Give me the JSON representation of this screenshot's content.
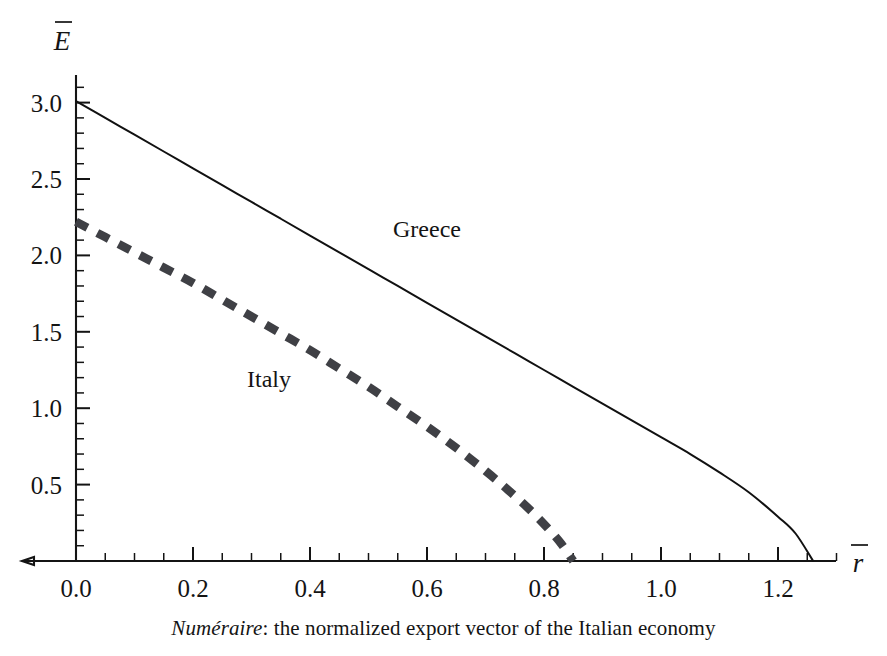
{
  "chart_data": {
    "type": "line",
    "title": "",
    "subtitle": "",
    "caption_emphasis": "Numéraire",
    "caption_rest": ": the normalized export vector of the Italian economy",
    "caption_full": "Numéraire: the normalized export vector of the Italian economy",
    "xlabel": "r",
    "xlabel_display": "r̄",
    "ylabel": "E",
    "ylabel_display": "Ē",
    "xlim": [
      0.0,
      1.32
    ],
    "ylim": [
      0.0,
      3.12
    ],
    "x_major_ticks": [
      0.0,
      0.2,
      0.4,
      0.6,
      0.8,
      1.0,
      1.2
    ],
    "x_tick_labels": [
      "0.0",
      "0.2",
      "0.4",
      "0.6",
      "0.8",
      "1.0",
      "1.2"
    ],
    "x_minor_step": 0.05,
    "y_major_ticks": [
      0.5,
      1.0,
      1.5,
      2.0,
      2.5,
      3.0
    ],
    "y_tick_labels": [
      "0.5",
      "1.0",
      "1.5",
      "2.0",
      "2.5",
      "3.0"
    ],
    "y_minor_step": 0.1,
    "grid": false,
    "legend_position": "inline-annotations",
    "series": [
      {
        "name": "Greece",
        "label": "Greece",
        "style": "solid",
        "color": "#111111",
        "linewidth": 2.0,
        "annotation_x": 0.6,
        "annotation_y": 2.12,
        "intercept_y": 3.01,
        "intercept_x": 1.26,
        "x": [
          0.0,
          0.05,
          0.1,
          0.15,
          0.2,
          0.25,
          0.3,
          0.35,
          0.4,
          0.45,
          0.5,
          0.55,
          0.6,
          0.65,
          0.7,
          0.75,
          0.8,
          0.85,
          0.9,
          0.95,
          1.0,
          1.05,
          1.1,
          1.15,
          1.2,
          1.23,
          1.26
        ],
        "y": [
          3.01,
          2.9,
          2.79,
          2.68,
          2.57,
          2.46,
          2.35,
          2.24,
          2.13,
          2.02,
          1.91,
          1.8,
          1.69,
          1.58,
          1.47,
          1.36,
          1.25,
          1.14,
          1.03,
          0.92,
          0.81,
          0.7,
          0.58,
          0.45,
          0.29,
          0.18,
          0.0
        ]
      },
      {
        "name": "Italy",
        "label": "Italy",
        "style": "dashed",
        "color": "#3f4045",
        "linewidth": 8.5,
        "dash_pattern": [
          13,
          11
        ],
        "annotation_x": 0.33,
        "annotation_y": 1.14,
        "intercept_y": 2.22,
        "intercept_x": 0.85,
        "x": [
          0.0,
          0.05,
          0.1,
          0.15,
          0.2,
          0.25,
          0.3,
          0.35,
          0.4,
          0.45,
          0.5,
          0.55,
          0.6,
          0.65,
          0.7,
          0.74,
          0.78,
          0.81,
          0.83,
          0.85
        ],
        "y": [
          2.22,
          2.12,
          2.02,
          1.92,
          1.82,
          1.71,
          1.6,
          1.49,
          1.38,
          1.26,
          1.14,
          1.01,
          0.88,
          0.74,
          0.59,
          0.46,
          0.32,
          0.2,
          0.11,
          0.0
        ]
      }
    ]
  },
  "figure": {
    "x_axis_name": "horizontal-axis",
    "y_axis_name": "vertical-axis"
  }
}
